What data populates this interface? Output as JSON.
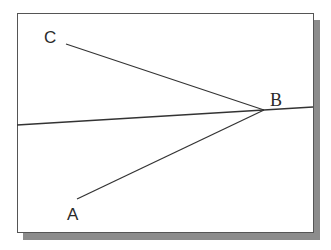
{
  "diagram": {
    "frame": {
      "x": 17,
      "y": 13,
      "width": 296,
      "height": 219,
      "border_color": "#555555",
      "shadow_color": "#8c8c8c",
      "shadow_offset": 7
    },
    "points": {
      "A": {
        "label": "A",
        "label_x": 67,
        "label_y": 206,
        "end_x": 77,
        "end_y": 199
      },
      "B": {
        "label": "B",
        "label_x": 270,
        "label_y": 91,
        "vertex_x": 264,
        "vertex_y": 110
      },
      "C": {
        "label": "C",
        "label_x": 44,
        "label_y": 29,
        "end_x": 66,
        "end_y": 44
      }
    },
    "lines": [
      {
        "name": "segment-cb",
        "from": "C",
        "to": "B",
        "x1": 66,
        "y1": 44,
        "x2": 264,
        "y2": 110
      },
      {
        "name": "segment-ab",
        "from": "A",
        "to": "B",
        "x1": 77,
        "y1": 199,
        "x2": 264,
        "y2": 110
      },
      {
        "name": "long-line",
        "x1": 17,
        "y1": 125,
        "x2": 313,
        "y2": 107
      }
    ],
    "line_color": "#333333"
  }
}
